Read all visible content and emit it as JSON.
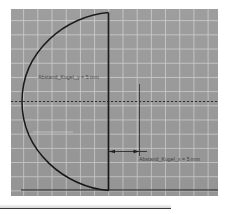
{
  "window": {
    "title": "CAD sketch view"
  },
  "canvas": {
    "background_color": "#9a9a9a",
    "grid_color": "#cdcdcd",
    "grid_spacing_px": 14,
    "line_color": "#1e1e1e"
  },
  "annotations": [
    {
      "id": "abstand-kugel-y",
      "text": "Abstand_Kugel_y = 5 mm",
      "parameter": "Abstand_Kugel_y",
      "value": "5",
      "unit": "mm"
    },
    {
      "id": "abstand-kugel-x",
      "text": "Abstand_Kugel_x = 5 mm",
      "parameter": "Abstand_Kugel_x",
      "value": "5",
      "unit": "mm"
    }
  ],
  "geometry": {
    "arc_label": "semicircular-arc",
    "vertical_edge_label": "vertical-edge",
    "baseline_label": "horizontal-baseline",
    "centerline_label": "horizontal-centerline-dashed",
    "dimension_line_label": "dimension-line-x",
    "extension_line_label": "extension-line-vertical"
  }
}
